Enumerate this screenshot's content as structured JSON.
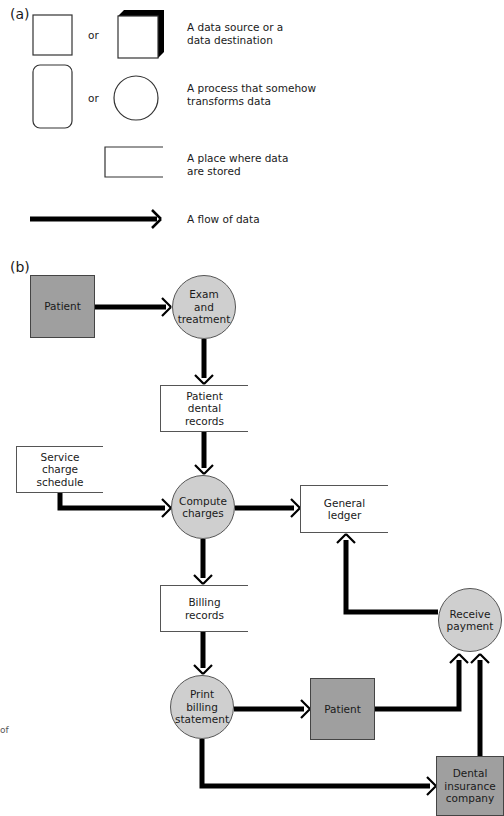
{
  "part_a": {
    "label": "(a)",
    "legend": [
      {
        "shapes": [
          "square",
          "3d-box"
        ],
        "or": "or",
        "description": "A data source or a\ndata destination"
      },
      {
        "shapes": [
          "rounded-rectangle",
          "circle"
        ],
        "or": "or",
        "description": "A process that somehow\ntransforms data"
      },
      {
        "shapes": [
          "open-rectangle"
        ],
        "description": "A place where data\nare stored"
      },
      {
        "shapes": [
          "thick-arrow"
        ],
        "description": "A flow of data"
      }
    ]
  },
  "part_b": {
    "label": "(b)",
    "nodes": {
      "patient_1": "Patient",
      "exam": "Exam\nand\ntreatment",
      "dental_records": "Patient\ndental\nrecords",
      "service_schedule": "Service\ncharge\nschedule",
      "compute": "Compute\ncharges",
      "ledger": "General\nledger",
      "billing_records": "Billing\nrecords",
      "receive": "Receive\npayment",
      "print": "Print\nbilling\nstatement",
      "patient_2": "Patient",
      "insurance": "Dental\ninsurance\ncompany"
    },
    "flows": [
      [
        "Patient",
        "Exam and treatment"
      ],
      [
        "Exam and treatment",
        "Patient dental records"
      ],
      [
        "Patient dental records",
        "Compute charges"
      ],
      [
        "Service charge schedule",
        "Compute charges"
      ],
      [
        "Compute charges",
        "General ledger"
      ],
      [
        "Compute charges",
        "Billing records"
      ],
      [
        "Billing records",
        "Print billing statement"
      ],
      [
        "Print billing statement",
        "Patient"
      ],
      [
        "Print billing statement",
        "Dental insurance company"
      ],
      [
        "Patient",
        "Receive payment"
      ],
      [
        "Dental insurance company",
        "Receive payment"
      ],
      [
        "Receive payment",
        "General ledger"
      ]
    ]
  },
  "margin_fragment": "of",
  "colors": {
    "external_entity": "#9f9f9f",
    "process": "#cfcfcf",
    "arrow": "#000000"
  }
}
